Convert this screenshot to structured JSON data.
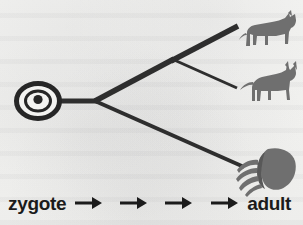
{
  "figure": {
    "name": "zygote-to-adult-development-diagram",
    "background_color": "#f3f3f1",
    "ink_color": "#2a2a2a",
    "silhouette_color": "#6e6e6e"
  },
  "diagram": {
    "zygote_cell": {
      "icon": "zygote-cell-icon",
      "description": "oval cell outline with nucleus dot",
      "cx": 38,
      "cy": 101,
      "rx": 21,
      "ry": 17,
      "nucleus_r": 4.5
    },
    "stem": {
      "x1": 58,
      "y1": 101,
      "x2": 96,
      "y2": 101
    },
    "nodes": [
      {
        "name": "root-node",
        "x": 96,
        "y": 101
      },
      {
        "name": "upper-split-node",
        "x": 173,
        "y": 60
      }
    ],
    "branches": [
      {
        "name": "branch-root-to-upper-node",
        "x1": 96,
        "y1": 101,
        "x2": 173,
        "y2": 60,
        "width": 5
      },
      {
        "name": "branch-upper-node-to-dog",
        "x1": 173,
        "y1": 60,
        "x2": 237,
        "y2": 27,
        "width": 5
      },
      {
        "name": "branch-upper-node-to-fox",
        "x1": 173,
        "y1": 60,
        "x2": 236,
        "y2": 88,
        "width": 3
      },
      {
        "name": "branch-root-to-beetle",
        "x1": 96,
        "y1": 101,
        "x2": 243,
        "y2": 166,
        "width": 4
      }
    ],
    "tips": [
      {
        "name": "dog-silhouette",
        "icon": "dog-icon",
        "label": "dog",
        "x": 240,
        "y": 10,
        "w": 58,
        "h": 42
      },
      {
        "name": "fox-silhouette",
        "icon": "fox-icon",
        "label": "fox",
        "x": 240,
        "y": 63,
        "w": 58,
        "h": 44
      },
      {
        "name": "beetle-silhouette",
        "icon": "beetle-icon",
        "label": "beetle",
        "x": 236,
        "y": 143,
        "w": 62,
        "h": 52
      }
    ]
  },
  "caption": {
    "start_label": "zygote",
    "end_label": "adult",
    "arrows": [
      {
        "name": "caption-arrow-1",
        "glyph": "arrow-right-icon"
      },
      {
        "name": "caption-arrow-2",
        "glyph": "arrow-right-icon"
      },
      {
        "name": "caption-arrow-3",
        "glyph": "arrow-right-icon"
      },
      {
        "name": "caption-arrow-4",
        "glyph": "arrow-right-icon"
      }
    ],
    "arrow_count": 4
  }
}
